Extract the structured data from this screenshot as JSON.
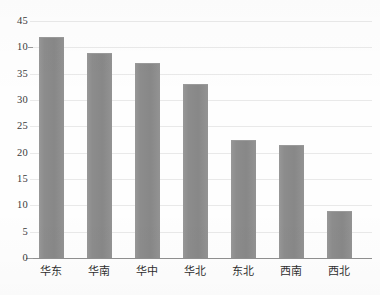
{
  "chart_data": {
    "type": "bar",
    "title": "",
    "subtitle": "",
    "xlabel": "",
    "ylabel": "",
    "categories": [
      "华东",
      "华南",
      "华中",
      "华北",
      "东北",
      "西南",
      "西北"
    ],
    "values": [
      42,
      39,
      37,
      33,
      22.5,
      21.5,
      9
    ],
    "ylim": [
      0,
      45
    ],
    "ytick_values": [
      45,
      40,
      35,
      30,
      25,
      20,
      15,
      10,
      5,
      0
    ],
    "ytick_labels": [
      "45",
      "10",
      "35",
      "30",
      "25",
      "20",
      "15",
      "10",
      "5",
      "0"
    ],
    "grid": "horizontal",
    "legend": "none",
    "series": [
      {
        "name": "",
        "values": [
          42,
          39,
          37,
          33,
          22.5,
          21.5,
          9
        ],
        "color": "#8c8c8c"
      }
    ]
  },
  "style": {
    "bar_color": "#8c8c8c",
    "bar_edge_color": "#9a9a9a",
    "gridline_color": "#e9e9e9",
    "axis_color": "#8f8f8f",
    "tick_label_color": "#3a3a3a",
    "category_label_color": "#2f2f2f",
    "background": "#fefefe"
  }
}
